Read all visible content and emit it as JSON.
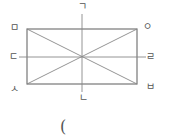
{
  "diagram": {
    "type": "rectangle-with-lines-of-symmetry",
    "stroke_color": "#777777",
    "label_color": "#555555",
    "rectangle": {
      "x": 27,
      "y": 29,
      "width": 110,
      "height": 55
    },
    "lines": {
      "vertical_midline": {
        "from_label": "ㄱ",
        "to_label": "ㄴ"
      },
      "horizontal_midline": {
        "from_label": "ㄷ",
        "to_label": "ㄹ"
      },
      "diagonal_1": {
        "from_label": "ㅁ",
        "to_label": "ㅂ"
      },
      "diagonal_2": {
        "from_label": "ㅅ",
        "to_label": "ㅇ"
      }
    },
    "labels": {
      "top": "ㄱ",
      "bottom": "ㄴ",
      "left": "ㄷ",
      "right": "ㄹ",
      "top_left": "ㅁ",
      "bottom_right": "ㅂ",
      "bottom_left": "ㅅ",
      "top_right": "ㅇ"
    }
  },
  "answer_blank": {
    "open_paren": "("
  }
}
